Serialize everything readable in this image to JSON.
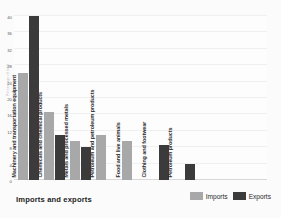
{
  "chart_data": {
    "type": "bar",
    "title": "Imports and exports",
    "xlabel": "",
    "ylabel": "Percentage of total",
    "ylim": [
      0,
      40
    ],
    "yticks": [
      0,
      4,
      8,
      12,
      16,
      20,
      24,
      28,
      32,
      36,
      40
    ],
    "grid": true,
    "legend_position": "bottom-right",
    "categories": [
      "Machinery and transportation equipment",
      "Chemicals and chemical products",
      "Metals and processed metals",
      "Petroleum and petroleum products",
      "Food and live animals",
      "Clothing and footwear",
      "Petroleum products"
    ],
    "series": [
      {
        "name": "Imports",
        "color": "#a8a8a8",
        "values": [
          26,
          16.5,
          9.5,
          11,
          9.5,
          null,
          null
        ]
      },
      {
        "name": "Exports",
        "color": "#3b3b3b",
        "values": [
          40,
          11,
          8,
          null,
          null,
          8.5,
          4
        ]
      }
    ]
  },
  "legend": {
    "items": [
      {
        "label": "Imports",
        "swatch": "imports-swatch"
      },
      {
        "label": "Exports",
        "swatch": "exports-swatch"
      }
    ]
  },
  "colors": {
    "imports": "#a8a8a8",
    "exports": "#3b3b3b",
    "background": "#fbfbfb",
    "plot_background": "#fdfdfd",
    "gridline": "#f0f0f0"
  }
}
